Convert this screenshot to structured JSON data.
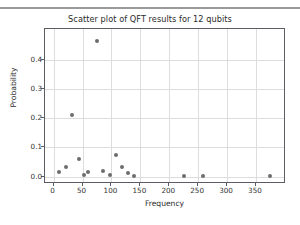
{
  "window": {
    "top_bar_present": true
  },
  "figure": {
    "background_color": "#ffffff",
    "axes_color": "#5b5d63",
    "grid_color": "#dddddd",
    "marker_color": "#6d6d6d"
  },
  "chart_data": {
    "type": "scatter",
    "title": "Scatter plot of QFT results for 12 qubits",
    "xlabel": "Frequency",
    "ylabel": "Probability",
    "xlim": [
      -15,
      402
    ],
    "ylim": [
      -0.025,
      0.505
    ],
    "grid": true,
    "legend": null,
    "xticks": [
      0,
      50,
      100,
      150,
      200,
      250,
      300,
      350
    ],
    "xtick_labels": [
      "0",
      "50",
      "100",
      "150",
      "200",
      "250",
      "300",
      "350"
    ],
    "yticks": [
      0.0,
      0.1,
      0.2,
      0.3,
      0.4
    ],
    "ytick_labels": [
      "0.0",
      "0.1",
      "0.2",
      "0.3",
      "0.4"
    ],
    "marker": "circle",
    "marker_size": 4,
    "points": [
      {
        "x": 10,
        "y": 0.016
      },
      {
        "x": 22,
        "y": 0.032
      },
      {
        "x": 32,
        "y": 0.211
      },
      {
        "x": 43,
        "y": 0.059
      },
      {
        "x": 53,
        "y": 0.006
      },
      {
        "x": 59,
        "y": 0.016
      },
      {
        "x": 75,
        "y": 0.465
      },
      {
        "x": 85,
        "y": 0.021
      },
      {
        "x": 97,
        "y": 0.007
      },
      {
        "x": 107,
        "y": 0.074
      },
      {
        "x": 118,
        "y": 0.033
      },
      {
        "x": 129,
        "y": 0.012
      },
      {
        "x": 139,
        "y": 0.003
      },
      {
        "x": 226,
        "y": 0.001
      },
      {
        "x": 258,
        "y": 0.001
      },
      {
        "x": 375,
        "y": 0.001
      }
    ]
  }
}
